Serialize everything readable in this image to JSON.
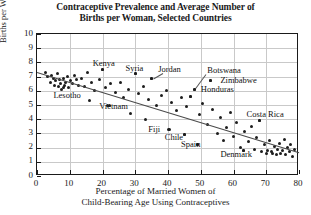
{
  "chart_data": {
    "type": "scatter",
    "title": "Contraceptive Prevalence and Average Number of Births per Woman, Selected Countries",
    "title_line1": "Contraceptive Prevalence and Average Number of",
    "title_line2": "Births per Woman, Selected Countries",
    "xlabel": "Percentage of Married Women of Child-Bearing Age Using Contraceptives",
    "xlabel_line1": "Percentage of Married Women of",
    "xlabel_line2": "Child-Bearing Age Using Contraceptives",
    "ylabel": "Births per Woman",
    "xlim": [
      0,
      80
    ],
    "ylim": [
      0,
      10
    ],
    "xticks": [
      0,
      10,
      20,
      30,
      40,
      50,
      60,
      70,
      80
    ],
    "yticks": [
      0,
      1,
      2,
      3,
      4,
      5,
      6,
      7,
      8,
      9,
      10
    ],
    "grid": true,
    "legend": false,
    "marker_color": "#1d1d1d",
    "trendline": {
      "x0": 0,
      "y0": 7.35,
      "x1": 80,
      "y1": 1.7,
      "color": "#4a4a4a"
    },
    "annotations": [
      {
        "label": "Kenya",
        "x": 17,
        "y": 7.9,
        "point_x": 20,
        "point_y": 7.5
      },
      {
        "label": "Syria",
        "x": 27,
        "y": 7.6,
        "point_x": 30,
        "point_y": 7.2
      },
      {
        "label": "Jordan",
        "x": 37,
        "y": 7.5,
        "point_x": 35,
        "point_y": 6.9
      },
      {
        "label": "Botswana",
        "x": 52,
        "y": 7.4,
        "point_x": 48,
        "point_y": 6.1
      },
      {
        "label": "Zimbabwe",
        "x": 56,
        "y": 6.7,
        "point_x": 53,
        "point_y": 6.7
      },
      {
        "label": "Honduras",
        "x": 50,
        "y": 6.1,
        "point_x": 47,
        "point_y": 5.6
      },
      {
        "label": "Lesotho",
        "x": 5,
        "y": 5.7,
        "point_x": 8,
        "point_y": 6.2
      },
      {
        "label": "Vietnam",
        "x": 19,
        "y": 4.9,
        "point_x": 22,
        "point_y": 5.0
      },
      {
        "label": "Costa Rica",
        "x": 64,
        "y": 4.3,
        "point_x": 68,
        "point_y": 3.9
      },
      {
        "label": "Fiji",
        "x": 34,
        "y": 3.3,
        "point_x": 40,
        "point_y": 3.3
      },
      {
        "label": "Chile",
        "x": 39,
        "y": 2.7,
        "point_x": 45,
        "point_y": 2.9
      },
      {
        "label": "Spain",
        "x": 44,
        "y": 2.2,
        "point_x": 49,
        "point_y": 2.2
      },
      {
        "label": "Denmark",
        "x": 56,
        "y": 1.5,
        "point_x": 63,
        "point_y": 1.8
      }
    ],
    "points": [
      {
        "x": 2.5,
        "y": 7.3
      },
      {
        "x": 3.2,
        "y": 7.0
      },
      {
        "x": 4.0,
        "y": 6.6
      },
      {
        "x": 4.5,
        "y": 7.1
      },
      {
        "x": 5.0,
        "y": 6.9
      },
      {
        "x": 5.4,
        "y": 6.4
      },
      {
        "x": 5.8,
        "y": 6.7
      },
      {
        "x": 6.2,
        "y": 7.2
      },
      {
        "x": 6.6,
        "y": 6.3
      },
      {
        "x": 7.0,
        "y": 6.8
      },
      {
        "x": 7.3,
        "y": 6.5
      },
      {
        "x": 7.6,
        "y": 6.1
      },
      {
        "x": 8.0,
        "y": 6.9
      },
      {
        "x": 8.4,
        "y": 6.4
      },
      {
        "x": 8.8,
        "y": 6.6
      },
      {
        "x": 9.2,
        "y": 7.0
      },
      {
        "x": 9.6,
        "y": 6.2
      },
      {
        "x": 10.2,
        "y": 6.7
      },
      {
        "x": 10.8,
        "y": 6.5
      },
      {
        "x": 11.4,
        "y": 7.1
      },
      {
        "x": 12.0,
        "y": 6.8
      },
      {
        "x": 12.8,
        "y": 6.4
      },
      {
        "x": 13.5,
        "y": 6.9
      },
      {
        "x": 14.5,
        "y": 6.3
      },
      {
        "x": 15.5,
        "y": 7.3
      },
      {
        "x": 16.5,
        "y": 6.6
      },
      {
        "x": 17.5,
        "y": 6.0
      },
      {
        "x": 19.0,
        "y": 6.8
      },
      {
        "x": 20.0,
        "y": 7.5
      },
      {
        "x": 21.0,
        "y": 6.2
      },
      {
        "x": 22.5,
        "y": 6.5
      },
      {
        "x": 24.0,
        "y": 5.9
      },
      {
        "x": 25.5,
        "y": 6.6
      },
      {
        "x": 26.5,
        "y": 5.5
      },
      {
        "x": 28.0,
        "y": 6.1
      },
      {
        "x": 30.0,
        "y": 7.2
      },
      {
        "x": 31.0,
        "y": 5.8
      },
      {
        "x": 32.5,
        "y": 6.3
      },
      {
        "x": 34.0,
        "y": 5.4
      },
      {
        "x": 35.0,
        "y": 6.9
      },
      {
        "x": 36.5,
        "y": 5.0
      },
      {
        "x": 38.0,
        "y": 5.7
      },
      {
        "x": 39.5,
        "y": 6.0
      },
      {
        "x": 40.5,
        "y": 3.3
      },
      {
        "x": 41.0,
        "y": 5.2
      },
      {
        "x": 42.5,
        "y": 4.6
      },
      {
        "x": 44.0,
        "y": 5.5
      },
      {
        "x": 45.0,
        "y": 2.9
      },
      {
        "x": 45.5,
        "y": 4.9
      },
      {
        "x": 47.0,
        "y": 5.6
      },
      {
        "x": 48.0,
        "y": 6.1
      },
      {
        "x": 49.0,
        "y": 2.2
      },
      {
        "x": 49.5,
        "y": 4.3
      },
      {
        "x": 50.5,
        "y": 5.1
      },
      {
        "x": 52.0,
        "y": 3.6
      },
      {
        "x": 53.0,
        "y": 6.7
      },
      {
        "x": 53.5,
        "y": 4.7
      },
      {
        "x": 55.0,
        "y": 3.0
      },
      {
        "x": 56.0,
        "y": 4.1
      },
      {
        "x": 57.0,
        "y": 2.5
      },
      {
        "x": 58.0,
        "y": 3.4
      },
      {
        "x": 59.0,
        "y": 4.5
      },
      {
        "x": 60.0,
        "y": 2.8
      },
      {
        "x": 61.0,
        "y": 3.8
      },
      {
        "x": 62.0,
        "y": 2.0
      },
      {
        "x": 63.0,
        "y": 1.8
      },
      {
        "x": 63.5,
        "y": 3.1
      },
      {
        "x": 64.5,
        "y": 2.4
      },
      {
        "x": 65.5,
        "y": 3.5
      },
      {
        "x": 66.5,
        "y": 1.9
      },
      {
        "x": 67.0,
        "y": 2.7
      },
      {
        "x": 68.0,
        "y": 3.9
      },
      {
        "x": 68.5,
        "y": 1.7
      },
      {
        "x": 69.5,
        "y": 2.2
      },
      {
        "x": 70.0,
        "y": 1.6
      },
      {
        "x": 70.5,
        "y": 1.8
      },
      {
        "x": 71.0,
        "y": 2.5
      },
      {
        "x": 71.5,
        "y": 1.7
      },
      {
        "x": 72.0,
        "y": 1.6
      },
      {
        "x": 72.5,
        "y": 2.1
      },
      {
        "x": 73.0,
        "y": 1.5
      },
      {
        "x": 73.5,
        "y": 1.9
      },
      {
        "x": 74.0,
        "y": 2.3
      },
      {
        "x": 74.5,
        "y": 1.6
      },
      {
        "x": 75.0,
        "y": 1.8
      },
      {
        "x": 75.5,
        "y": 2.6
      },
      {
        "x": 76.0,
        "y": 1.5
      },
      {
        "x": 76.5,
        "y": 2.0
      },
      {
        "x": 77.0,
        "y": 1.7
      },
      {
        "x": 77.5,
        "y": 2.2
      },
      {
        "x": 78.0,
        "y": 1.4
      },
      {
        "x": 78.5,
        "y": 1.9
      },
      {
        "x": 28.5,
        "y": 4.4
      },
      {
        "x": 33.0,
        "y": 4.0
      },
      {
        "x": 21.5,
        "y": 5.0
      },
      {
        "x": 16.0,
        "y": 5.3
      }
    ],
    "leader_lines": [
      {
        "x0": 38.5,
        "y0": 7.25,
        "x1": 35.5,
        "y1": 6.85
      },
      {
        "x0": 51.5,
        "y0": 7.2,
        "x1": 48.3,
        "y1": 6.2
      }
    ]
  }
}
